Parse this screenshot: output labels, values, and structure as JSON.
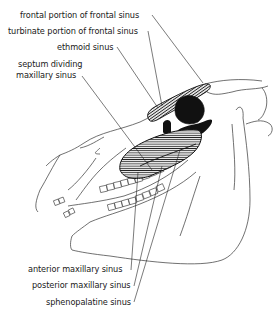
{
  "diagram": {
    "colors": {
      "ink": "#1a1a1a",
      "background": "#ffffff",
      "fill_solid": "#111111",
      "hatch": "#222222"
    },
    "labels_top": [
      {
        "id": "frontal-portion",
        "text": "frontal portion of frontal sinus"
      },
      {
        "id": "turbinate-portion",
        "text": "turbinate portion of frontal sinus"
      },
      {
        "id": "ethmoid",
        "text": "ethmoid sinus"
      },
      {
        "id": "septum-line1",
        "text": "septum dividing"
      },
      {
        "id": "septum-line2",
        "text": "maxillary sinus"
      }
    ],
    "labels_bottom": [
      {
        "id": "anterior-maxillary",
        "text": "anterior maxillary sinus"
      },
      {
        "id": "posterior-maxillary",
        "text": "posterior maxillary sinus"
      },
      {
        "id": "sphenopalatine",
        "text": "sphenopalatine sinus"
      }
    ]
  }
}
